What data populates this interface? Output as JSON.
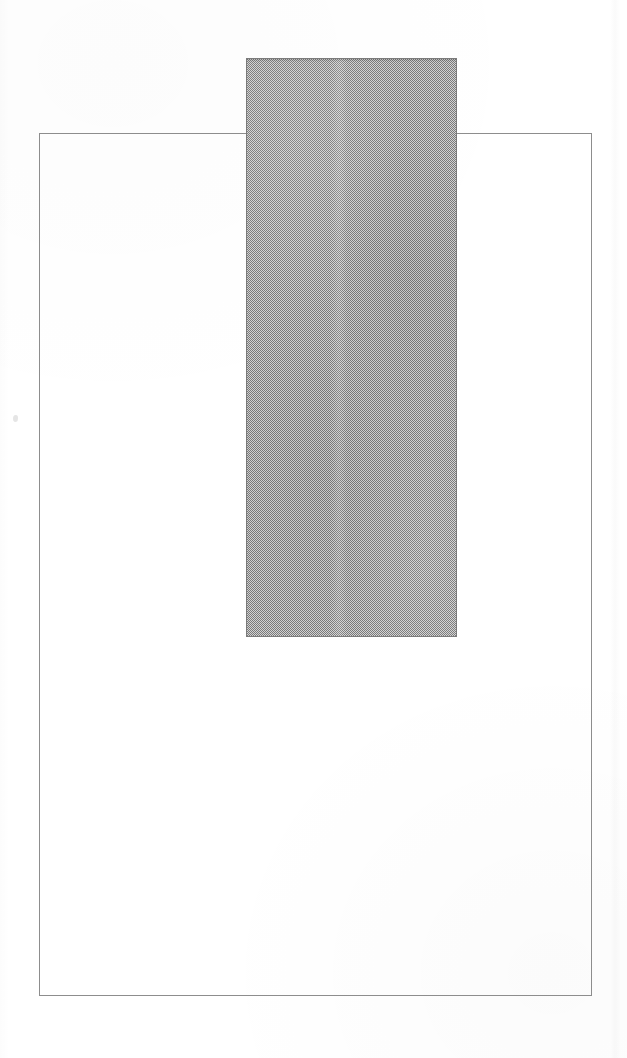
{
  "canvas": {
    "width": 627,
    "height": 1058,
    "background_color": "#ffffff",
    "label": ""
  },
  "figure": {
    "title": "",
    "caption": ""
  },
  "shapes": [
    {
      "name": "outline-rectangle",
      "type": "rectangle",
      "fill": "none",
      "stroke_color": "#8d8d8d",
      "stroke_width": 1,
      "x": 39,
      "y": 133,
      "width": 553,
      "height": 863,
      "label": "",
      "z": 1
    },
    {
      "name": "halftone-rectangle",
      "type": "rectangle",
      "fill": "#9c9c9c",
      "fill_pattern": "halftone-dither",
      "stroke_color": "#7b7b7b",
      "stroke_width": 1,
      "x": 246,
      "y": 58,
      "width": 211,
      "height": 579,
      "label": "",
      "z": 2,
      "opaque": true
    }
  ],
  "artifacts": [
    {
      "name": "scan-speck",
      "x": 13,
      "y": 415,
      "width": 5,
      "height": 7
    },
    {
      "name": "scan-band-right",
      "x": 610,
      "y": 0,
      "width": 11,
      "height": 1058
    }
  ],
  "colors": {
    "paper": "#ffffff",
    "outline_stroke": "#8d8d8d",
    "halftone_fill": "#9c9c9c",
    "halftone_stroke": "#7b7b7b"
  }
}
